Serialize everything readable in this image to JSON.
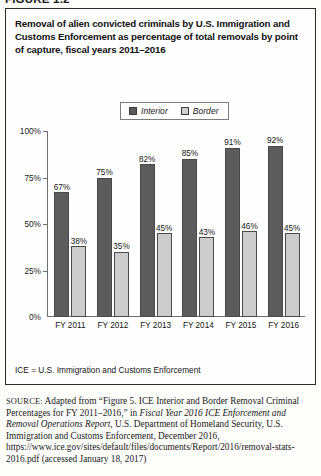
{
  "figure": {
    "number": "FIGURE 1.2",
    "title": "Removal of alien convicted criminals by U.S. Immigration and Customs Enforcement as percentage of total removals by point of capture, fiscal years 2011–2016",
    "note": "ICE = U.S. Immigration and Customs Enforcement"
  },
  "source": {
    "keyword": "SOURCE:",
    "part1": " Adapted from “Figure 5. ICE Interior and Border Removal Criminal Percentages for FY 2011–2016,” in ",
    "italic1": "Fiscal Year 2016 ICE Enforcement and Removal Operations Report",
    "part2": ", U.S. Department of Homeland Security, U.S. Immigration and Customs Enforcement, December 2016, https://www.ice.gov/sites/default/files/documents/Report/2016/removal-stats-2016.pdf (accessed January 18, 2017)"
  },
  "legend": {
    "items": [
      {
        "label": "Interior",
        "color": "#5c5c5c"
      },
      {
        "label": "Border",
        "color": "#cccccc"
      }
    ]
  },
  "chart_data": {
    "type": "bar",
    "title": "Removal of alien convicted criminals by U.S. Immigration and Customs Enforcement as percentage of total removals by point of capture, fiscal years 2011–2016",
    "xlabel": "",
    "ylabel": "",
    "categories": [
      "FY 2011",
      "FY 2012",
      "FY 2013",
      "FY 2014",
      "FY 2015",
      "FY 2016"
    ],
    "series": [
      {
        "name": "Interior",
        "color": "#5c5c5c",
        "values": [
          67,
          75,
          82,
          85,
          91,
          92
        ],
        "labels": [
          "67%",
          "75%",
          "82%",
          "85%",
          "91%",
          "92%"
        ]
      },
      {
        "name": "Border",
        "color": "#cccccc",
        "values": [
          38,
          35,
          45,
          43,
          46,
          45
        ],
        "labels": [
          "38%",
          "35%",
          "45%",
          "43%",
          "46%",
          "45%"
        ]
      }
    ],
    "ylim": [
      0,
      100
    ],
    "yticks": [
      0,
      25,
      50,
      75,
      100
    ],
    "ytick_labels": [
      "0%",
      "25%",
      "50%",
      "75%",
      "100%"
    ],
    "grid": false,
    "legend_position": "top-center"
  }
}
